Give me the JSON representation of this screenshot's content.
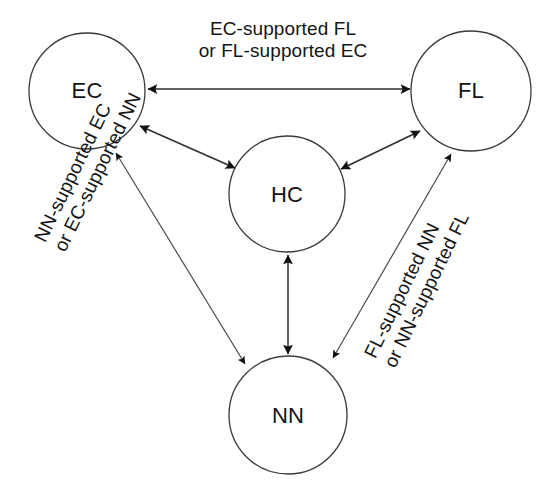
{
  "diagram": {
    "type": "relationship-diagram",
    "background_color": "#ffffff",
    "stroke_color": "#2e2e2e",
    "text_color": "#141414",
    "nodes": [
      {
        "id": "EC",
        "label": "EC",
        "cx": 87,
        "cy": 91,
        "r": 58
      },
      {
        "id": "FL",
        "label": "FL",
        "cx": 471,
        "cy": 91,
        "r": 60
      },
      {
        "id": "HC",
        "label": "HC",
        "cx": 287,
        "cy": 194,
        "r": 58
      },
      {
        "id": "NN",
        "label": "NN",
        "cx": 288,
        "cy": 415,
        "r": 59
      }
    ],
    "edges": [
      {
        "id": "ec-fl",
        "from": "EC",
        "to": "FL",
        "arrow": "double",
        "label_id": "label-ec-fl"
      },
      {
        "id": "ec-hc",
        "from": "EC",
        "to": "HC",
        "arrow": "double",
        "label_id": null
      },
      {
        "id": "hc-fl",
        "from": "HC",
        "to": "FL",
        "arrow": "double",
        "label_id": null
      },
      {
        "id": "hc-nn",
        "from": "HC",
        "to": "NN",
        "arrow": "double",
        "label_id": null
      },
      {
        "id": "ec-nn",
        "from": "EC",
        "to": "NN",
        "arrow": "double",
        "label_id": "label-ec-nn"
      },
      {
        "id": "fl-nn",
        "from": "FL",
        "to": "NN",
        "arrow": "double",
        "label_id": "label-fl-nn"
      }
    ],
    "labels": {
      "ec_fl": {
        "line1": "EC-supported FL",
        "line2": "or FL-supported EC",
        "rotation_deg": 0
      },
      "ec_nn": {
        "line1": "NN-supported EC",
        "line2": "or EC-supported NN",
        "rotation_deg": -64
      },
      "fl_nn": {
        "line1": "FL-supported NN",
        "line2": "or NN-supported FL",
        "rotation_deg": -64
      }
    }
  }
}
